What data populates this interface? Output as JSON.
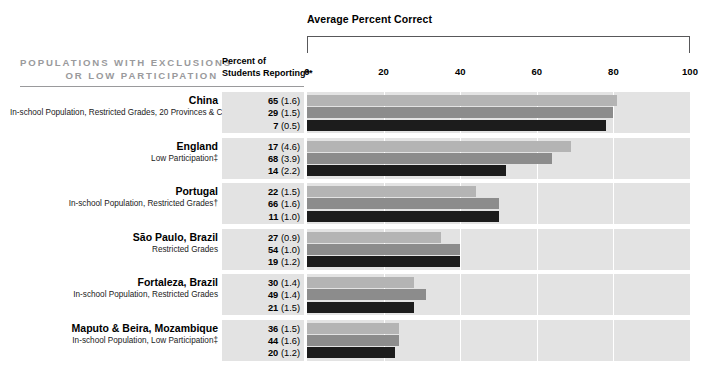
{
  "header": {
    "title_lines": [
      "POPULATIONS WITH EXCLUSIONS",
      "OR LOW PARTICIPATION"
    ],
    "percent_col_lines": [
      "Percent of",
      "Students Reporting**"
    ],
    "chart_title": "Average Percent Correct"
  },
  "chart_data": {
    "type": "bar",
    "orientation": "horizontal",
    "title": "Average Percent Correct",
    "xlabel": "",
    "ylabel": "",
    "xlim": [
      0,
      100
    ],
    "ticks": [
      0,
      20,
      40,
      60,
      80,
      100
    ],
    "tick_labels": [
      "0",
      "20",
      "40",
      "60",
      "80",
      "100"
    ],
    "gridlines": [
      20,
      40,
      60,
      80
    ],
    "grid": true,
    "legend": null,
    "series_colors": [
      "#b4b4b4",
      "#8c8c8c",
      "#1c1c1c"
    ],
    "categories": [
      "China",
      "England",
      "Portugal",
      "São Paulo, Brazil",
      "Fortaleza, Brazil",
      "Maputo & Beira, Mozambique"
    ],
    "series": [
      {
        "name": "group-1",
        "values": [
          81,
          69,
          44,
          35,
          28,
          24
        ]
      },
      {
        "name": "group-2",
        "values": [
          80,
          64,
          50,
          40,
          31,
          24
        ]
      },
      {
        "name": "group-3",
        "values": [
          78,
          52,
          50,
          40,
          28,
          23
        ]
      }
    ],
    "percent_reporting": {
      "China": [
        {
          "value": "65",
          "se": "(1.6)"
        },
        {
          "value": "29",
          "se": "(1.5)"
        },
        {
          "value": "7",
          "se": "(0.5)"
        }
      ],
      "England": [
        {
          "value": "17",
          "se": "(4.6)"
        },
        {
          "value": "68",
          "se": "(3.9)"
        },
        {
          "value": "14",
          "se": "(2.2)"
        }
      ],
      "Portugal": [
        {
          "value": "22",
          "se": "(1.5)"
        },
        {
          "value": "66",
          "se": "(1.6)"
        },
        {
          "value": "11",
          "se": "(1.0)"
        }
      ],
      "São Paulo, Brazil": [
        {
          "value": "27",
          "se": "(0.9)"
        },
        {
          "value": "54",
          "se": "(1.0)"
        },
        {
          "value": "19",
          "se": "(1.2)"
        }
      ],
      "Fortaleza, Brazil": [
        {
          "value": "30",
          "se": "(1.4)"
        },
        {
          "value": "49",
          "se": "(1.4)"
        },
        {
          "value": "21",
          "se": "(1.5)"
        }
      ],
      "Maputo & Beira, Mozambique": [
        {
          "value": "36",
          "se": "(1.5)"
        },
        {
          "value": "44",
          "se": "(1.6)"
        },
        {
          "value": "20",
          "se": "(1.2)"
        }
      ]
    }
  },
  "rows": [
    {
      "name": "China",
      "subtitle": "In-school Population, Restricted Grades, 20 Provinces & Cities",
      "values": [
        {
          "n": "65",
          "se": "(1.6)"
        },
        {
          "n": "29",
          "se": "(1.5)"
        },
        {
          "n": "7",
          "se": "(0.5)"
        }
      ],
      "bars": [
        81,
        80,
        78
      ]
    },
    {
      "name": "England",
      "subtitle": "Low Participation‡",
      "values": [
        {
          "n": "17",
          "se": "(4.6)"
        },
        {
          "n": "68",
          "se": "(3.9)"
        },
        {
          "n": "14",
          "se": "(2.2)"
        }
      ],
      "bars": [
        69,
        64,
        52
      ]
    },
    {
      "name": "Portugal",
      "subtitle": "In-school Population, Restricted Grades†",
      "values": [
        {
          "n": "22",
          "se": "(1.5)"
        },
        {
          "n": "66",
          "se": "(1.6)"
        },
        {
          "n": "11",
          "se": "(1.0)"
        }
      ],
      "bars": [
        44,
        50,
        50
      ]
    },
    {
      "name": "São Paulo, Brazil",
      "subtitle": "Restricted Grades",
      "values": [
        {
          "n": "27",
          "se": "(0.9)"
        },
        {
          "n": "54",
          "se": "(1.0)"
        },
        {
          "n": "19",
          "se": "(1.2)"
        }
      ],
      "bars": [
        35,
        40,
        40
      ]
    },
    {
      "name": "Fortaleza, Brazil",
      "subtitle": "In-school Population, Restricted Grades",
      "values": [
        {
          "n": "30",
          "se": "(1.4)"
        },
        {
          "n": "49",
          "se": "(1.4)"
        },
        {
          "n": "21",
          "se": "(1.5)"
        }
      ],
      "bars": [
        28,
        31,
        28
      ]
    },
    {
      "name": "Maputo & Beira, Mozambique",
      "subtitle": "In-school Population, Low Participation‡",
      "values": [
        {
          "n": "36",
          "se": "(1.5)"
        },
        {
          "n": "44",
          "se": "(1.6)"
        },
        {
          "n": "20",
          "se": "(1.2)"
        }
      ],
      "bars": [
        24,
        24,
        23
      ]
    }
  ],
  "colors": {
    "bar_light": "#b4b4b4",
    "bar_medium": "#8c8c8c",
    "bar_dark": "#1c1c1c",
    "band": "#e3e3e3",
    "header_gray": "#9a9a9c",
    "rule": "#58585a"
  }
}
